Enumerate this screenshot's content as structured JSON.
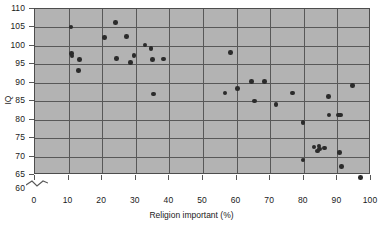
{
  "figure": {
    "cropped_header": "",
    "background_color": "#b3b3b3",
    "point_color": "#2b2b2b",
    "grid_color": "#585858"
  },
  "axes": {
    "x_title": "Religion important (%)",
    "y_title": "IQ",
    "x_ticks": [
      "0",
      "10",
      "20",
      "30",
      "40",
      "50",
      "60",
      "70",
      "80",
      "90",
      "100"
    ],
    "y_ticks": [
      "60",
      "65",
      "70",
      "75",
      "80",
      "85",
      "90",
      "95",
      "100",
      "105",
      "110"
    ],
    "y_axis_break": true,
    "y_axis_break_note": "axis broken below 65 (60 shown beneath break)"
  },
  "chart_data": {
    "type": "scatter",
    "title": "",
    "xlabel": "Religion important (%)",
    "ylabel": "IQ",
    "xlim": [
      0,
      100
    ],
    "ylim": [
      60,
      110
    ],
    "grid": true,
    "legend": "none",
    "series": [
      {
        "name": "Countries",
        "points": [
          [
            11.0,
            104.8
          ],
          [
            11.2,
            97.6
          ],
          [
            11.3,
            97.0
          ],
          [
            13.2,
            93.0
          ],
          [
            13.6,
            96.0
          ],
          [
            21.0,
            102.0
          ],
          [
            24.3,
            106.0
          ],
          [
            24.5,
            96.3
          ],
          [
            27.5,
            102.2
          ],
          [
            28.8,
            95.3
          ],
          [
            29.8,
            97.2
          ],
          [
            33.0,
            100.0
          ],
          [
            34.8,
            99.0
          ],
          [
            35.3,
            96.0
          ],
          [
            35.5,
            86.7
          ],
          [
            38.5,
            96.2
          ],
          [
            58.5,
            98.0
          ],
          [
            56.8,
            87.0
          ],
          [
            60.5,
            88.2
          ],
          [
            64.8,
            90.0
          ],
          [
            65.6,
            84.8
          ],
          [
            68.6,
            90.0
          ],
          [
            72.0,
            83.8
          ],
          [
            77.0,
            87.0
          ],
          [
            80.0,
            79.0
          ],
          [
            80.0,
            68.8
          ],
          [
            83.3,
            72.3
          ],
          [
            84.3,
            71.2
          ],
          [
            84.8,
            72.6
          ],
          [
            85.0,
            71.8
          ],
          [
            86.5,
            72.0
          ],
          [
            87.6,
            86.0
          ],
          [
            87.8,
            81.0
          ],
          [
            90.7,
            81.0
          ],
          [
            91.3,
            81.0
          ],
          [
            91.0,
            70.8
          ],
          [
            91.6,
            67.0
          ],
          [
            94.8,
            89.0
          ],
          [
            97.2,
            64.0
          ]
        ]
      }
    ]
  }
}
